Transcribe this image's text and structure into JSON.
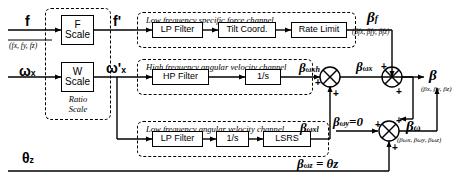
{
  "diagram": {
    "background": "#ffffff",
    "line_color": "#000000"
  },
  "inputs": {
    "force": {
      "symbol": "f",
      "components": "(f",
      "components_full": "(fx, fy, fz)",
      "cx": "fx",
      "cy": "fy",
      "cz": "fz"
    },
    "omega": {
      "symbol": "ω",
      "sub": "x"
    },
    "theta": {
      "symbol": "θ",
      "sub": "z"
    }
  },
  "scale_blocks": [
    {
      "line1": "F",
      "line2": "Scale"
    },
    {
      "line1": "W",
      "line2": "Scale"
    }
  ],
  "scale_caption": {
    "line1": "Ratio",
    "line2": "Scale"
  },
  "signals": {
    "f_prime": {
      "symbol": "f",
      "prime": "'"
    },
    "omega_prime": {
      "symbol": "ω",
      "prime": "'",
      "sub": "x"
    }
  },
  "channels": [
    {
      "name": "low-frequency-specific-force",
      "caption": "Low frequency specific force channel",
      "blocks": [
        "LP Filter",
        "Tilt Coord.",
        "Rate Limit"
      ]
    },
    {
      "name": "high-frequency-angular-velocity",
      "caption": "High frequency angular velocity channel",
      "blocks": [
        "HP Filter",
        "1/s"
      ]
    },
    {
      "name": "low-frequency-angular-velocity",
      "caption": "Low frequency angular velocity channel",
      "blocks": [
        "LP Filter",
        "1/s",
        "LSRS"
      ]
    }
  ],
  "outputs": {
    "beta_f": {
      "symbol": "β",
      "sub": "f",
      "components": "(βfx, βfy, βfz)"
    },
    "beta_wxh": {
      "symbol": "β",
      "sub": "ωxh"
    },
    "beta_wxl": {
      "symbol": "β",
      "sub": "ωxl"
    },
    "beta_wx": {
      "symbol": "β",
      "sub": "ωx"
    },
    "beta_wy": {
      "symbol": "β",
      "sub": "ωy",
      "value": "=0"
    },
    "beta_wz": {
      "symbol": "β",
      "sub": "ωz",
      "value": "= θz"
    },
    "beta_w": {
      "symbol": "β",
      "sub": "ω",
      "components": "(βωx, βωy, βωz)"
    },
    "beta": {
      "symbol": "β",
      "components": "(βx, βy, βz)"
    }
  },
  "summing_junctions": [
    {
      "name": "beta-wx-sum",
      "signs": [
        "+",
        "+"
      ]
    },
    {
      "name": "beta-w-sum",
      "signs": [
        "+",
        "+",
        "+"
      ]
    },
    {
      "name": "beta-sum",
      "signs": [
        "+",
        "+"
      ]
    }
  ]
}
